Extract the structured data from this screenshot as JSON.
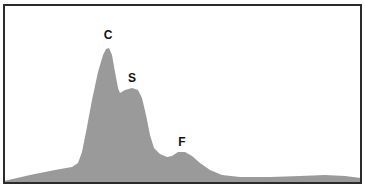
{
  "chart_data": {
    "type": "area",
    "title": "",
    "xlabel": "",
    "ylabel": "",
    "grid": false,
    "legend": null,
    "fill_color": "#9a9a9a",
    "frame_color": "#2b2b2b",
    "annotations": [
      {
        "label": "C",
        "x": 108,
        "y": 39
      },
      {
        "label": "S",
        "x": 132,
        "y": 82
      },
      {
        "label": "F",
        "x": 182,
        "y": 146
      }
    ],
    "profile_points_px": [
      [
        4,
        181
      ],
      [
        30,
        175
      ],
      [
        55,
        170
      ],
      [
        72,
        167
      ],
      [
        78,
        163
      ],
      [
        82,
        152
      ],
      [
        86,
        132
      ],
      [
        92,
        100
      ],
      [
        98,
        72
      ],
      [
        103,
        55
      ],
      [
        106,
        49
      ],
      [
        109,
        48
      ],
      [
        112,
        55
      ],
      [
        115,
        72
      ],
      [
        118,
        88
      ],
      [
        120,
        93
      ],
      [
        125,
        90
      ],
      [
        132,
        88
      ],
      [
        138,
        90
      ],
      [
        142,
        98
      ],
      [
        146,
        115
      ],
      [
        150,
        135
      ],
      [
        154,
        148
      ],
      [
        160,
        154
      ],
      [
        167,
        157
      ],
      [
        172,
        156
      ],
      [
        178,
        152
      ],
      [
        185,
        152
      ],
      [
        192,
        156
      ],
      [
        200,
        163
      ],
      [
        210,
        170
      ],
      [
        222,
        175
      ],
      [
        240,
        177
      ],
      [
        270,
        177
      ],
      [
        300,
        176
      ],
      [
        325,
        175
      ],
      [
        345,
        176
      ],
      [
        361,
        178
      ],
      [
        361,
        183
      ],
      [
        4,
        183
      ]
    ],
    "peaks": [
      {
        "name": "C",
        "relative_height": 1.0
      },
      {
        "name": "S",
        "relative_height": 0.7
      },
      {
        "name": "F",
        "relative_height": 0.23
      }
    ]
  }
}
